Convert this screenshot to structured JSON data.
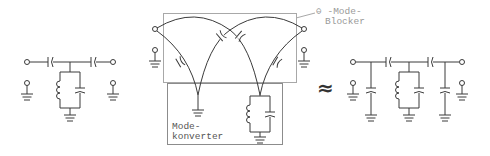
{
  "diagram": {
    "type": "circuit-schematic",
    "left_circuit": {
      "description": "T-network: two series capacitors with shunt parallel LC tank to ground"
    },
    "center_circuit": {
      "mode_blocker_label": {
        "symbol": "⊖",
        "line1": "-Mode-",
        "line2": "Blocker"
      },
      "mode_converter_label": {
        "line1": "Mode-",
        "line2": "konverter"
      }
    },
    "approx_symbol": "≈",
    "right_circuit": {
      "description": "Pi-T network: shunt capacitors at ports, series capacitors, shunt parallel LC tank"
    },
    "colors": {
      "wire": "#3a3a3a",
      "box": "#8c8c8c",
      "label_light": "#999999"
    }
  }
}
